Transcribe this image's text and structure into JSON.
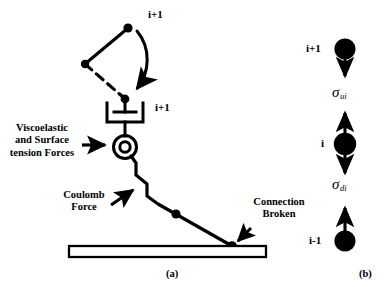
{
  "figure": {
    "panel_a": {
      "caption": "(a)",
      "labels": {
        "top_node": "i+1",
        "pivot_node": "i+1",
        "viscoelastic": "Viscoelastic\nand Surface\ntension Forces",
        "coulomb": "Coulomb\nForce",
        "connection_broken": "Connection\nBroken"
      },
      "icons": {
        "rotation_arrow": "curved-rotation-arrow-icon",
        "damper": "dashpot-damper-icon",
        "spring_circle": "annulus-joint-icon",
        "zigzag_chain": "zigzag-chain-icon",
        "substrate": "substrate-bar-icon",
        "viscoelastic_arrow": "right-arrow-icon",
        "coulomb_arrow": "diagonal-arrow-icon",
        "broken_arrow": "diagonal-arrow-icon"
      }
    },
    "panel_b": {
      "caption": "(b)",
      "nodes": [
        {
          "label": "i+1",
          "name": "node-i-plus-1"
        },
        {
          "label": "i",
          "name": "node-i"
        },
        {
          "label": "i-1",
          "name": "node-i-minus-1"
        }
      ],
      "stresses": [
        {
          "symbol": "σ",
          "subscript": "ui",
          "name": "sigma-ui"
        },
        {
          "symbol": "σ",
          "subscript": "di",
          "name": "sigma-di"
        }
      ],
      "icons": {
        "arrow_down": "down-arrow-icon",
        "arrow_up": "up-arrow-icon",
        "arrow_updown": "up-down-arrow-icon"
      }
    },
    "colors": {
      "ink": "#000000",
      "background": "#ffffff"
    }
  }
}
